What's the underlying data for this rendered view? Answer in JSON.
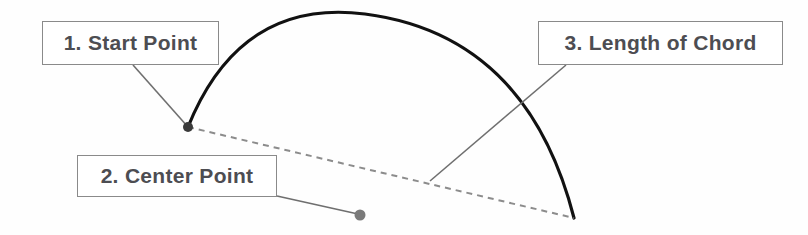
{
  "diagram": {
    "background_color": "#fefefe",
    "callouts": [
      {
        "id": "start-point",
        "label": "1. Start Point",
        "box": {
          "x": 42,
          "y": 21,
          "w": 177,
          "h": 44
        },
        "text_color": "#4d4d52",
        "border_color": "#8a8a8a"
      },
      {
        "id": "center-point",
        "label": "2. Center Point",
        "box": {
          "x": 77,
          "y": 155,
          "w": 200,
          "h": 42
        },
        "text_color": "#4d4d52",
        "border_color": "#8a8a8a"
      },
      {
        "id": "length-of-chord",
        "label": "3. Length of Chord",
        "box": {
          "x": 538,
          "y": 21,
          "w": 245,
          "h": 44
        },
        "text_color": "#4d4d52",
        "border_color": "#8a8a8a"
      }
    ],
    "geometry": {
      "arc": {
        "name": "arc-curve",
        "start": {
          "x": 188,
          "y": 127
        },
        "apex": {
          "x": 365,
          "y": 14
        },
        "end": {
          "x": 574,
          "y": 218
        },
        "stroke": "#111111",
        "stroke_width": 3.2,
        "style": "solid"
      },
      "chord": {
        "name": "chord-dashed-line",
        "from": {
          "x": 188,
          "y": 127
        },
        "to": {
          "x": 574,
          "y": 218
        },
        "stroke": "#8c8c8c",
        "stroke_width": 2,
        "style": "dashed",
        "dash_pattern": "6 5"
      },
      "points": [
        {
          "name": "start-point-dot",
          "x": 188,
          "y": 127,
          "radius": 5,
          "fill": "#3a3a3a"
        },
        {
          "name": "center-point-dot",
          "x": 360,
          "y": 215,
          "radius": 5.5,
          "fill": "#7a7a7a"
        }
      ],
      "leaders": [
        {
          "name": "leader-start-point",
          "from": {
            "x": 133,
            "y": 65
          },
          "to": {
            "x": 188,
            "y": 127
          },
          "stroke": "#6f6f6f",
          "stroke_width": 1.6
        },
        {
          "name": "leader-center-point",
          "from": {
            "x": 277,
            "y": 196
          },
          "to": {
            "x": 358,
            "y": 214
          },
          "stroke": "#6f6f6f",
          "stroke_width": 1.6
        },
        {
          "name": "leader-length-of-chord",
          "from": {
            "x": 566,
            "y": 65
          },
          "to": {
            "x": 430,
            "y": 181
          },
          "stroke": "#6f6f6f",
          "stroke_width": 1.6
        }
      ]
    }
  }
}
